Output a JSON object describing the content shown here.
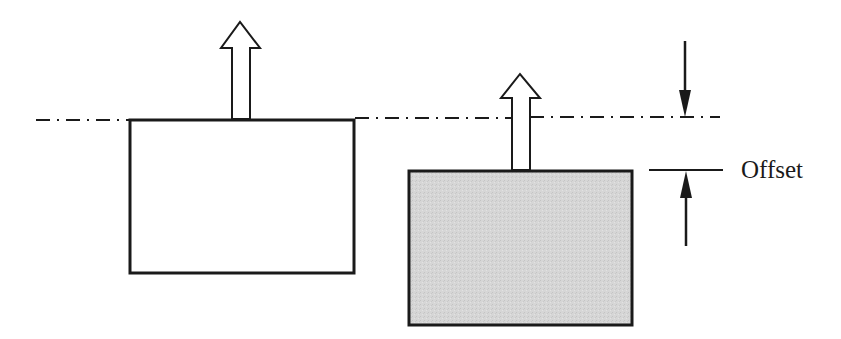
{
  "diagram": {
    "type": "offset-illustration",
    "labels": {
      "offset": "Offset"
    },
    "colors": {
      "stroke": "#1a1a1a",
      "shaded_fill": "#d4d4d4",
      "background": "#ffffff"
    },
    "elements": [
      {
        "name": "reference-line",
        "style": "dash-dot"
      },
      {
        "name": "unshifted-box",
        "fill": "white",
        "arrow": "hollow-up"
      },
      {
        "name": "offset-box",
        "fill": "gray",
        "arrow": "hollow-up"
      },
      {
        "name": "dimension-arrow-top",
        "direction": "down"
      },
      {
        "name": "dimension-arrow-bottom",
        "direction": "up"
      }
    ]
  }
}
